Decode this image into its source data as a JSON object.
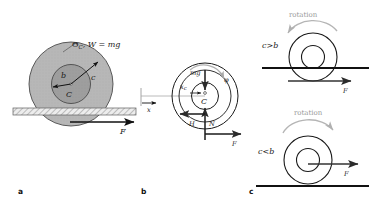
{
  "figure": {
    "caption_panels": [
      "a",
      "b",
      "c"
    ]
  },
  "panel_a": {
    "letter": "a",
    "top_label": "Θ",
    "top_label_sub": "C",
    "top_label_rest": ", W = mg",
    "radius_outer_label": "c",
    "radius_inner_label": "b",
    "center_label": "C",
    "force_label": "F",
    "ground": "hatched-ground",
    "colors": {
      "disk_outer_fill": "#b4b4b4",
      "disk_inner_fill": "#9a9a9a",
      "outline": "#444444",
      "ground_fill": "#e8e8e8",
      "arrow": "#111111"
    }
  },
  "panel_b": {
    "letter": "b",
    "x_axis_label": "x",
    "xc_label": "x",
    "xc_label_sub": "c",
    "weight_label": "mg",
    "center_label": "C",
    "friction_label": "H",
    "normal_label": "N",
    "force_label": "F",
    "phi_label": "φ",
    "colors": {
      "outline": "#1a1a1a",
      "arrow": "#1a1a1a",
      "axis": "#9a9a9a",
      "rotation_arrow": "#b0b0b0"
    }
  },
  "panel_c": {
    "letter": "c",
    "cases": [
      {
        "rotation_label": "rotation",
        "condition_prefix": "c",
        "condition_op": ">",
        "condition_suffix": "b",
        "force_label": "F"
      },
      {
        "rotation_label": "rotation",
        "condition_prefix": "c",
        "condition_op": "<",
        "condition_suffix": "b",
        "force_label": "F"
      }
    ],
    "colors": {
      "outline": "#1a1a1a",
      "ground": "#111111",
      "arrow": "#333333",
      "rotation_arrow": "#b5b5b5",
      "rotation_text": "#9a9a9a"
    }
  }
}
